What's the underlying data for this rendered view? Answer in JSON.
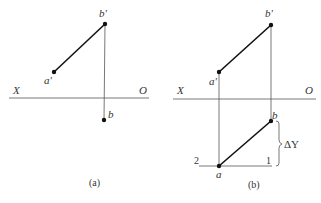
{
  "diagram": {
    "type": "orthographic projection of line segment AB",
    "panels": [
      {
        "id": "a",
        "caption": "(a)",
        "axis": {
          "left_label": "X",
          "right_label": "O"
        },
        "points": [
          {
            "name": "a_prime",
            "label": "a'"
          },
          {
            "name": "b_prime",
            "label": "b'"
          },
          {
            "name": "b",
            "label": "b"
          }
        ],
        "segments": [
          "a'-b'",
          "b'-b (projection line)",
          "X-O axis"
        ]
      },
      {
        "id": "b",
        "caption": "(b)",
        "axis": {
          "left_label": "X",
          "right_label": "O"
        },
        "points": [
          {
            "name": "a_prime",
            "label": "a'"
          },
          {
            "name": "b_prime",
            "label": "b'"
          },
          {
            "name": "b",
            "label": "b"
          },
          {
            "name": "a",
            "label": "a"
          }
        ],
        "markers": {
          "point1": "1",
          "point2": "2"
        },
        "dimension": {
          "label": "ΔY"
        },
        "segments": [
          "a'-b'",
          "a-b",
          "a'-a (projection line)",
          "b'-b (projection line)",
          "2-1 horizontal",
          "X-O axis"
        ]
      }
    ]
  }
}
